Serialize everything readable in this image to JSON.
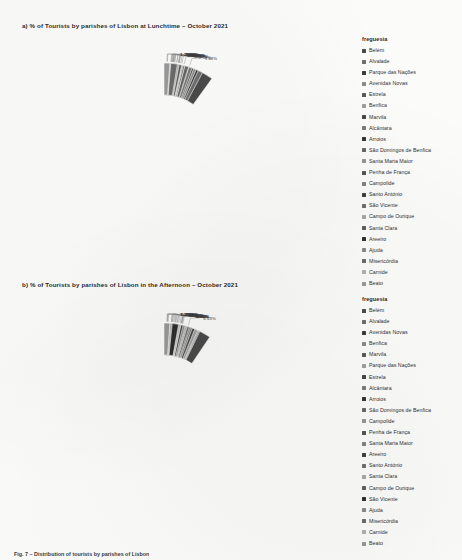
{
  "document": {
    "footer_caption": "Fig. 7 – Distribution of tourists by parishes of Lisbon"
  },
  "charts": [
    {
      "id": "a",
      "title": "a) % of Tourists by parishes of Lisbon at Lunchtime – October 2021",
      "legend_title": "freguesia"
    },
    {
      "id": "b",
      "title": "b) % of Tourists by parishes of Lisbon in the Afternoon – October 2021",
      "legend_title": "freguesia"
    }
  ],
  "chart_data": [
    {
      "type": "pie",
      "variant": "donut",
      "id": "chart-a",
      "title": "a) % of Tourists by parishes of Lisbon at Lunchtime – October 2021",
      "legend_title": "freguesia",
      "legend_position": "right",
      "value_suffix": "%",
      "categories": [
        "Belém",
        "Alvalade",
        "Parque das Nações",
        "Avenidas Novas",
        "Estrela",
        "Benfica",
        "Marvila",
        "Alcântara",
        "Arroios",
        "São Domingos de Benfica",
        "Santa Maria Maior",
        "Penha de França",
        "Campolide",
        "Santo António",
        "São Vicente",
        "Campo de Ourique",
        "Santa Clara",
        "Areeiro",
        "Ajuda",
        "Misericórdia",
        "Carnide",
        "Beato"
      ],
      "values": [
        9.68,
        7.57,
        6.67,
        6.24,
        5.5,
        5.45,
        5.75,
        5.42,
        4.79,
        4.73,
        3.98,
        3.97,
        3.69,
        3.16,
        3.22,
        3.5,
        3.39,
        2.87,
        2.79,
        2.55,
        1.28,
        1.1
      ],
      "labels": [
        "9.68%",
        "7.57%",
        "6.67%",
        "6.24%",
        "5.50%",
        "5.45%",
        "5.75%",
        "5.42%",
        "4.79%",
        "4.73%",
        "3.98%",
        "3.97%",
        "3.69%",
        "3.16%",
        "3.22%",
        "3.50%",
        "3.39%",
        "2.87%",
        "2.79%",
        "2.55%",
        "1.28%",
        "1.10%"
      ],
      "colors": [
        "#4a4a4a",
        "#6e6e6e",
        "#3c3c3c",
        "#8a8a8a",
        "#5a5a5a",
        "#9e9e9e",
        "#474747",
        "#7b7b7b",
        "#343434",
        "#676767",
        "#959595",
        "#555555",
        "#828282",
        "#414141",
        "#707070",
        "#a6a6a6",
        "#5f5f5f",
        "#2f2f2f",
        "#898989",
        "#6b6b6b",
        "#b0b0b0",
        "#989898"
      ]
    },
    {
      "type": "pie",
      "variant": "donut",
      "id": "chart-b",
      "title": "b) % of Tourists by parishes of Lisbon in the Afternoon – October 2021",
      "legend_title": "freguesia",
      "legend_position": "right",
      "value_suffix": "%",
      "categories": [
        "Belém",
        "Alvalade",
        "Avenidas Novas",
        "Benfica",
        "Marvila",
        "Parque das Nações",
        "Estrela",
        "Alcântara",
        "Arroios",
        "São Domingos de Benfica",
        "Campolide",
        "Penha de França",
        "Santa Maria Maior",
        "Areeiro",
        "Santo António",
        "Santa Clara",
        "Campo de Ourique",
        "São Vicente",
        "Ajuda",
        "Misericórdia",
        "Carnide",
        "Beato"
      ],
      "values": [
        8.69,
        6.65,
        6.09,
        6.44,
        6.11,
        6.24,
        5.66,
        5.17,
        4.8,
        4.61,
        4.22,
        3.97,
        3.82,
        3.46,
        3.06,
        2.98,
        2.66,
        2.63,
        1.48,
        1.29,
        1.1,
        1.05
      ],
      "labels": [
        "8.69%",
        "6.65%",
        "6.09%",
        "6.44%",
        "6.11%",
        "6.24%",
        "5.66%",
        "5.17%",
        "4.80%",
        "4.61%",
        "4.22%",
        "3.97%",
        "3.82%",
        "3.46%",
        "3.06%",
        "2.98%",
        "2.66%",
        "2.63%",
        "1.48%",
        "1.29%",
        "1.10%",
        "1.05%"
      ],
      "colors": [
        "#4a4a4a",
        "#6e6e6e",
        "#3c3c3c",
        "#8a8a8a",
        "#5a5a5a",
        "#9e9e9e",
        "#474747",
        "#7b7b7b",
        "#343434",
        "#676767",
        "#959595",
        "#555555",
        "#828282",
        "#414141",
        "#707070",
        "#a6a6a6",
        "#5f5f5f",
        "#2f2f2f",
        "#898989",
        "#6b6b6b",
        "#b0b0b0",
        "#989898"
      ]
    }
  ]
}
